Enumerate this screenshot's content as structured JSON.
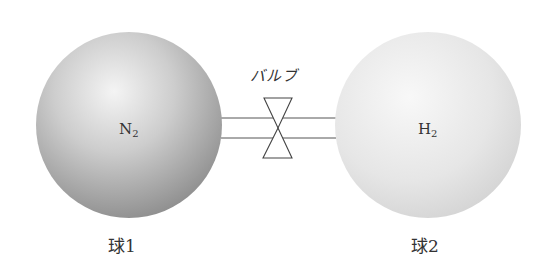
{
  "diagram": {
    "valve": {
      "label": "バルブ"
    },
    "spheres": [
      {
        "id": "sphere-1",
        "caption": "球1",
        "gas_symbol": "N",
        "gas_subscript": "2",
        "shade": "dark",
        "colors": {
          "highlight": "#f2f2f2",
          "mid": "#c4c4c4",
          "edge": "#8e8e8e"
        }
      },
      {
        "id": "sphere-2",
        "caption": "球2",
        "gas_symbol": "H",
        "gas_subscript": "2",
        "shade": "light",
        "colors": {
          "highlight": "#f7f7f7",
          "mid": "#e4e4e4",
          "edge": "#cfcfcf"
        }
      }
    ],
    "line_color": "#555555"
  }
}
